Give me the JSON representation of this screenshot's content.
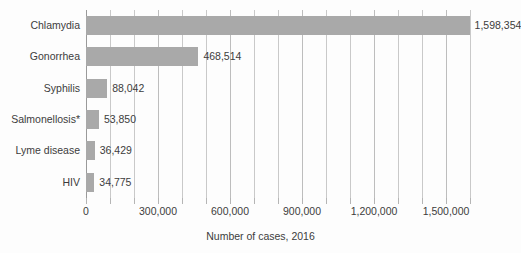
{
  "chart_data": {
    "type": "bar",
    "orientation": "horizontal",
    "title": "",
    "xlabel": "Number of cases, 2016",
    "ylabel": "",
    "categories": [
      "Chlamydia",
      "Gonorrhea",
      "Syphilis",
      "Salmonellosis*",
      "Lyme disease",
      "HIV"
    ],
    "values": [
      1598354,
      468514,
      88042,
      53850,
      36429,
      34775
    ],
    "value_labels": [
      "1,598,354",
      "468,514",
      "88,042",
      "53,850",
      "36,429",
      "34,775"
    ],
    "xlim": [
      0,
      1600000
    ],
    "xtick_values": [
      0,
      300000,
      600000,
      900000,
      1200000,
      1500000
    ],
    "xtick_labels": [
      "0",
      "300,000",
      "600,000",
      "900,000",
      "1,200,000",
      "1,500,000"
    ],
    "minor_gridline_step": 100000,
    "grid": "vertical",
    "legend": "none",
    "bar_color": "#a9a9a9",
    "gridline_color": "#c9c9c9",
    "background_color": "#fdfdfd",
    "text_color": "#3c3c3c"
  }
}
